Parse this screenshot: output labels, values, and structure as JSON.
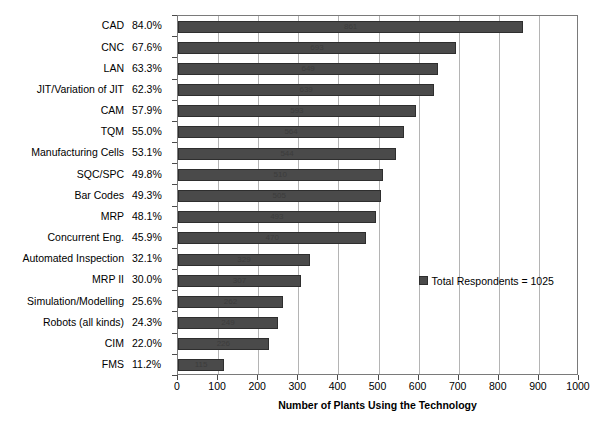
{
  "chart_data": {
    "type": "bar",
    "orientation": "horizontal",
    "title": "",
    "xlabel": "Number of Plants Using the Technology",
    "ylabel": "",
    "xlim": [
      0,
      1000
    ],
    "xticks": [
      0,
      100,
      200,
      300,
      400,
      500,
      600,
      700,
      800,
      900,
      1000
    ],
    "grid": true,
    "legend": {
      "position": "inside-right",
      "entries": [
        "Total Respondents = 1025"
      ]
    },
    "total_respondents": 1025,
    "categories": [
      "CAD",
      "CNC",
      "LAN",
      "JIT/Variation of JIT",
      "CAM",
      "TQM",
      "Manufacturing Cells",
      "SQC/SPC",
      "Bar Codes",
      "MRP",
      "Concurrent Eng.",
      "Automated Inspection",
      "MRP II",
      "Simulation/Modelling",
      "Robots (all kinds)",
      "CIM",
      "FMS"
    ],
    "percent_labels": [
      "84.0%",
      "67.6%",
      "63.3%",
      "62.3%",
      "57.9%",
      "55.0%",
      "53.1%",
      "49.8%",
      "49.3%",
      "48.1%",
      "45.9%",
      "32.1%",
      "30.0%",
      "25.6%",
      "24.3%",
      "22.0%",
      "11.2%"
    ],
    "values": [
      861,
      693,
      649,
      639,
      593,
      564,
      544,
      510,
      505,
      493,
      470,
      329,
      307,
      262,
      249,
      226,
      115
    ],
    "value_labels": [
      "861",
      "693",
      "649",
      "639",
      "593",
      "564",
      "544",
      "510",
      "505",
      "493",
      "470",
      "329",
      "307",
      "262",
      "249",
      "226",
      "115"
    ],
    "colors": {
      "bar_fill": "#4a4a4a",
      "bar_edge": "#2e2e2e",
      "gridline": "#b4b4b4",
      "axis": "#7a7a7a",
      "plot_background": "#ffffff",
      "text": "#000000"
    }
  }
}
